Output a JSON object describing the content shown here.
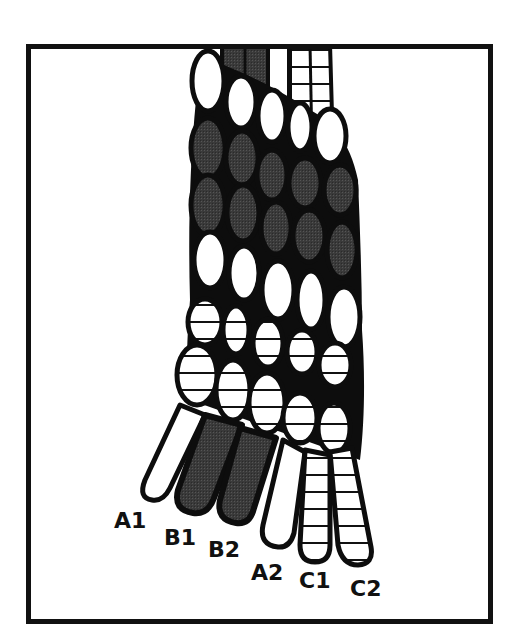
{
  "diagram": {
    "title": "",
    "colors": {
      "frame": "#111111",
      "outline": "#0d0d0d",
      "strand_A_fill": "#ffffff",
      "strand_B_fill": "#3a3a3a",
      "strand_C_fill": "#ffffff",
      "strand_C_stripe": "#111111"
    },
    "strand_types": [
      {
        "id": "A",
        "fill": "white",
        "description": "plain white strand"
      },
      {
        "id": "B",
        "fill": "dark-stipple",
        "description": "dark grey stippled strand"
      },
      {
        "id": "C",
        "fill": "striped",
        "description": "horizontally striped strand"
      }
    ],
    "rows": [
      {
        "index": 1,
        "type": "A"
      },
      {
        "index": 2,
        "type": "B"
      },
      {
        "index": 3,
        "type": "B"
      },
      {
        "index": 4,
        "type": "A"
      },
      {
        "index": 5,
        "type": "C"
      },
      {
        "index": 6,
        "type": "C"
      }
    ],
    "labels": [
      {
        "id": "A1",
        "text": "A1"
      },
      {
        "id": "B1",
        "text": "B1"
      },
      {
        "id": "B2",
        "text": "B2"
      },
      {
        "id": "A2",
        "text": "A2"
      },
      {
        "id": "C1",
        "text": "C1"
      },
      {
        "id": "C2",
        "text": "C2"
      }
    ]
  }
}
